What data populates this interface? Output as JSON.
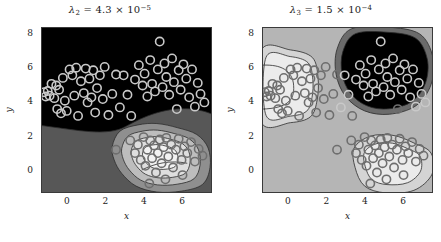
{
  "figure": {
    "background": "#ffffff",
    "width": 441,
    "height": 242
  },
  "chart_data": {
    "type": "contour",
    "title": "",
    "panels": [
      {
        "id": "panel-left",
        "title_text": "λ₂ = 4.3 × 10⁻⁵",
        "title_symbol": "λ",
        "title_subscript": "2",
        "title_equals": "=",
        "title_mantissa": "4.3",
        "title_times": "×",
        "title_base": "10",
        "title_exponent": "−5",
        "xlabel": "x",
        "ylabel": "y",
        "xticks": [
          0,
          2,
          4,
          6
        ],
        "yticks": [
          0,
          2,
          4,
          6,
          8
        ],
        "xlim": [
          -1.35,
          7.55
        ],
        "ylim": [
          -1.35,
          8.35
        ],
        "grid": false,
        "background_level_color": "#000000",
        "level_colors": [
          "#000000",
          "#575757",
          "#8f8f8f",
          "#bdbdbd",
          "#dedede",
          "#f2f2f2"
        ],
        "marker": {
          "shape": "circle-open",
          "radius_px": 4.2,
          "line_width_px": 1.6,
          "color_on_dark": "#c9c9c9",
          "color_on_light": "#6e6e6e"
        },
        "contour_line_color": "#2a2a2a",
        "points": [
          [
            -1.25,
            4.55
          ],
          [
            -1.15,
            4.3
          ],
          [
            -1.05,
            4.62
          ],
          [
            -0.95,
            4.35
          ],
          [
            -0.85,
            5.05
          ],
          [
            -0.7,
            4.2
          ],
          [
            -0.6,
            4.95
          ],
          [
            -0.55,
            3.55
          ],
          [
            -0.45,
            4.7
          ],
          [
            -0.35,
            3.3
          ],
          [
            -0.25,
            5.4
          ],
          [
            -0.15,
            4.05
          ],
          [
            -0.05,
            3.45
          ],
          [
            0.1,
            5.9
          ],
          [
            0.25,
            5.55
          ],
          [
            0.35,
            4.35
          ],
          [
            0.45,
            6.0
          ],
          [
            0.55,
            3.15
          ],
          [
            0.7,
            5.2
          ],
          [
            0.85,
            4.5
          ],
          [
            0.95,
            5.95
          ],
          [
            1.05,
            3.95
          ],
          [
            1.15,
            5.35
          ],
          [
            1.25,
            4.25
          ],
          [
            1.35,
            5.85
          ],
          [
            1.45,
            3.35
          ],
          [
            1.55,
            4.8
          ],
          [
            1.7,
            5.55
          ],
          [
            1.85,
            4.15
          ],
          [
            1.95,
            6.05
          ],
          [
            2.15,
            3.2
          ],
          [
            2.35,
            4.45
          ],
          [
            2.55,
            5.6
          ],
          [
            2.75,
            3.65
          ],
          [
            2.95,
            5.55
          ],
          [
            3.15,
            4.4
          ],
          [
            3.35,
            3.15
          ],
          [
            3.55,
            5.3
          ],
          [
            3.75,
            6.15
          ],
          [
            3.95,
            4.95
          ],
          [
            4.05,
            5.65
          ],
          [
            4.2,
            4.3
          ],
          [
            4.35,
            6.45
          ],
          [
            4.45,
            5.05
          ],
          [
            4.6,
            4.6
          ],
          [
            4.75,
            5.9
          ],
          [
            4.85,
            7.55
          ],
          [
            5.0,
            4.85
          ],
          [
            5.1,
            6.25
          ],
          [
            5.2,
            5.45
          ],
          [
            5.35,
            4.4
          ],
          [
            5.5,
            6.55
          ],
          [
            5.6,
            5.15
          ],
          [
            5.75,
            3.55
          ],
          [
            5.85,
            5.85
          ],
          [
            5.95,
            4.7
          ],
          [
            6.1,
            6.2
          ],
          [
            6.25,
            5.35
          ],
          [
            6.4,
            4.25
          ],
          [
            6.55,
            5.9
          ],
          [
            6.7,
            3.7
          ],
          [
            6.85,
            5.1
          ],
          [
            7.0,
            4.45
          ],
          [
            7.2,
            3.95
          ],
          [
            3.3,
            1.7
          ],
          [
            3.55,
            0.95
          ],
          [
            3.7,
            1.45
          ],
          [
            3.85,
            0.55
          ],
          [
            4.0,
            1.9
          ],
          [
            4.1,
            0.2
          ],
          [
            4.2,
            1.15
          ],
          [
            4.35,
            1.7
          ],
          [
            4.45,
            0.65
          ],
          [
            4.55,
            1.4
          ],
          [
            4.65,
            -0.2
          ],
          [
            4.75,
            0.95
          ],
          [
            4.85,
            1.75
          ],
          [
            4.95,
            0.35
          ],
          [
            5.05,
            1.3
          ],
          [
            5.2,
            1.85
          ],
          [
            5.3,
            0.75
          ],
          [
            5.45,
            1.45
          ],
          [
            5.55,
            0.1
          ],
          [
            5.7,
            1.15
          ],
          [
            5.85,
            1.8
          ],
          [
            6.0,
            0.55
          ],
          [
            6.15,
            1.35
          ],
          [
            6.3,
            0.95
          ],
          [
            6.5,
            1.6
          ],
          [
            6.7,
            0.45
          ],
          [
            6.9,
            1.2
          ],
          [
            7.1,
            0.8
          ],
          [
            2.55,
            1.15
          ],
          [
            4.3,
            -0.85
          ],
          [
            5.15,
            -0.6
          ],
          [
            6.05,
            -0.35
          ]
        ]
      },
      {
        "id": "panel-right",
        "title_text": "λ₃ = 1.5 × 10⁻⁴",
        "title_symbol": "λ",
        "title_subscript": "3",
        "title_equals": "=",
        "title_mantissa": "1.5",
        "title_times": "×",
        "title_base": "10",
        "title_exponent": "−4",
        "xlabel": "x",
        "ylabel": "y",
        "xticks": [
          0,
          2,
          4,
          6
        ],
        "yticks": [
          0,
          2,
          4,
          6,
          8
        ],
        "xlim": [
          -1.35,
          7.55
        ],
        "ylim": [
          -1.35,
          8.35
        ],
        "grid": false,
        "background_level_color": "#b5b5b5",
        "level_colors": [
          "#000000",
          "#6b6b6b",
          "#b5b5b5",
          "#d4d4d4",
          "#ebebeb",
          "#f7f7f7"
        ],
        "marker": {
          "shape": "circle-open",
          "radius_px": 4.2,
          "line_width_px": 1.6,
          "color_on_dark": "#c9c9c9",
          "color_on_light": "#6e6e6e"
        },
        "contour_line_color": "#2a2a2a",
        "points": [
          [
            -1.25,
            4.55
          ],
          [
            -1.15,
            4.3
          ],
          [
            -1.05,
            4.62
          ],
          [
            -0.95,
            4.35
          ],
          [
            -0.85,
            5.05
          ],
          [
            -0.7,
            4.2
          ],
          [
            -0.6,
            4.95
          ],
          [
            -0.55,
            3.55
          ],
          [
            -0.45,
            4.7
          ],
          [
            -0.35,
            3.3
          ],
          [
            -0.25,
            5.4
          ],
          [
            -0.15,
            4.05
          ],
          [
            -0.05,
            3.45
          ],
          [
            0.1,
            5.9
          ],
          [
            0.25,
            5.55
          ],
          [
            0.35,
            4.35
          ],
          [
            0.45,
            6.0
          ],
          [
            0.55,
            3.15
          ],
          [
            0.7,
            5.2
          ],
          [
            0.85,
            4.5
          ],
          [
            0.95,
            5.95
          ],
          [
            1.05,
            3.95
          ],
          [
            1.15,
            5.35
          ],
          [
            1.25,
            4.25
          ],
          [
            1.35,
            5.85
          ],
          [
            1.45,
            3.35
          ],
          [
            1.55,
            4.8
          ],
          [
            1.7,
            5.55
          ],
          [
            1.85,
            4.15
          ],
          [
            1.95,
            6.05
          ],
          [
            2.15,
            3.2
          ],
          [
            2.35,
            4.45
          ],
          [
            2.55,
            5.6
          ],
          [
            2.75,
            3.65
          ],
          [
            2.95,
            5.55
          ],
          [
            3.15,
            4.4
          ],
          [
            3.35,
            3.15
          ],
          [
            3.55,
            5.3
          ],
          [
            3.75,
            6.15
          ],
          [
            3.95,
            4.95
          ],
          [
            4.05,
            5.65
          ],
          [
            4.2,
            4.3
          ],
          [
            4.35,
            6.45
          ],
          [
            4.45,
            5.05
          ],
          [
            4.6,
            4.6
          ],
          [
            4.75,
            5.9
          ],
          [
            4.85,
            7.55
          ],
          [
            5.0,
            4.85
          ],
          [
            5.1,
            6.25
          ],
          [
            5.2,
            5.45
          ],
          [
            5.35,
            4.4
          ],
          [
            5.5,
            6.55
          ],
          [
            5.6,
            5.15
          ],
          [
            5.75,
            3.55
          ],
          [
            5.85,
            5.85
          ],
          [
            5.95,
            4.7
          ],
          [
            6.1,
            6.2
          ],
          [
            6.25,
            5.35
          ],
          [
            6.4,
            4.25
          ],
          [
            6.55,
            5.9
          ],
          [
            6.7,
            3.7
          ],
          [
            6.85,
            5.1
          ],
          [
            7.0,
            4.45
          ],
          [
            7.2,
            3.95
          ],
          [
            3.3,
            1.7
          ],
          [
            3.55,
            0.95
          ],
          [
            3.7,
            1.45
          ],
          [
            3.85,
            0.55
          ],
          [
            4.0,
            1.9
          ],
          [
            4.1,
            0.2
          ],
          [
            4.2,
            1.15
          ],
          [
            4.35,
            1.7
          ],
          [
            4.45,
            0.65
          ],
          [
            4.55,
            1.4
          ],
          [
            4.65,
            -0.2
          ],
          [
            4.75,
            0.95
          ],
          [
            4.85,
            1.75
          ],
          [
            4.95,
            0.35
          ],
          [
            5.05,
            1.3
          ],
          [
            5.2,
            1.85
          ],
          [
            5.3,
            0.75
          ],
          [
            5.45,
            1.45
          ],
          [
            5.55,
            0.1
          ],
          [
            5.7,
            1.15
          ],
          [
            5.85,
            1.8
          ],
          [
            6.0,
            0.55
          ],
          [
            6.15,
            1.35
          ],
          [
            6.3,
            0.95
          ],
          [
            6.5,
            1.6
          ],
          [
            6.7,
            0.45
          ],
          [
            6.9,
            1.2
          ],
          [
            7.1,
            0.8
          ],
          [
            2.55,
            1.15
          ],
          [
            4.3,
            -0.85
          ],
          [
            5.15,
            -0.6
          ],
          [
            6.05,
            -0.35
          ]
        ]
      }
    ]
  }
}
